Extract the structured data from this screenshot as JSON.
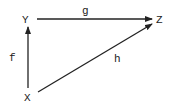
{
  "diagram": {
    "type": "commutative-triangle",
    "nodes": [
      {
        "id": "Y",
        "label": "Y",
        "x": 25,
        "y": 23
      },
      {
        "id": "Z",
        "label": "Z",
        "x": 160,
        "y": 23
      },
      {
        "id": "X",
        "label": "X",
        "x": 28,
        "y": 101
      }
    ],
    "edges": [
      {
        "from": "Y",
        "to": "Z",
        "label": "g"
      },
      {
        "from": "X",
        "to": "Y",
        "label": "f"
      },
      {
        "from": "X",
        "to": "Z",
        "label": "h"
      }
    ]
  },
  "labels": {
    "Y": "Y",
    "Z": "Z",
    "X": "X",
    "g": "g",
    "f": "f",
    "h": "h"
  }
}
